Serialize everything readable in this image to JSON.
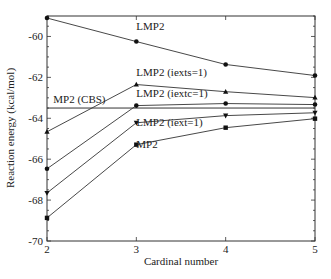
{
  "chart_data": {
    "type": "line",
    "title": "",
    "xlabel": "Cardinal number",
    "ylabel": "Reaction energy (kcal/mol)",
    "x": [
      2,
      3,
      4,
      5
    ],
    "xlim": [
      2,
      5
    ],
    "ylim": [
      -70,
      -59
    ],
    "xticks": [
      "2",
      "3",
      "4",
      "5"
    ],
    "yticks": [
      "-70",
      "-68",
      "-66",
      "-64",
      "-62",
      "-60"
    ],
    "grid": false,
    "legend": "inline labels",
    "series": [
      {
        "name": "LMP2",
        "marker": "circle",
        "values": [
          -59.1,
          -60.25,
          -61.37,
          -61.91
        ]
      },
      {
        "name": "LMP2 (iexts=1)",
        "marker": "triangle-up",
        "values": [
          -64.66,
          -62.35,
          -62.7,
          -62.99
        ]
      },
      {
        "name": "LMP2 (iextc=1)",
        "marker": "circle",
        "values": [
          -66.47,
          -63.38,
          -63.28,
          -63.33
        ]
      },
      {
        "name": "LMP2 (iext=1)",
        "marker": "triangle-down",
        "values": [
          -67.65,
          -64.22,
          -63.87,
          -63.73
        ]
      },
      {
        "name": "MP2",
        "marker": "square",
        "values": [
          -68.87,
          -65.29,
          -64.46,
          -64.02
        ]
      }
    ],
    "reference_lines": [
      {
        "name": "MP2 (CBS)",
        "value": -63.5
      }
    ],
    "annotations": [
      {
        "text": "LMP2",
        "x": 3,
        "y": -59.7
      },
      {
        "text": "LMP2 (iexts=1)",
        "x": 3,
        "y": -61.95
      },
      {
        "text": "LMP2 (iextc=1)",
        "x": 3,
        "y": -62.95
      },
      {
        "text": "LMP2 (iext=1)",
        "x": 3,
        "y": -64.4
      },
      {
        "text": "MP2",
        "x": 3,
        "y": -65.45
      },
      {
        "text": "MP2 (CBS)",
        "x": 2.07,
        "y": -63.25
      }
    ]
  }
}
